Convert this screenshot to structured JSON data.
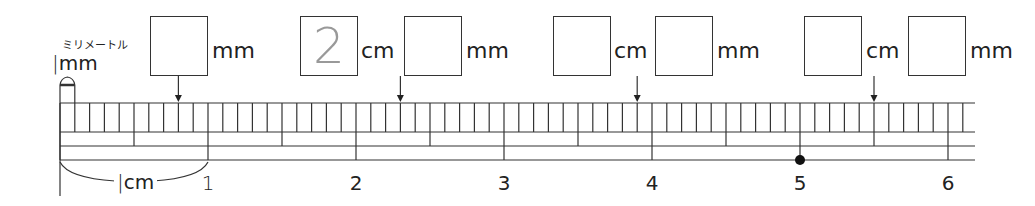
{
  "legend": {
    "mm_reading": "ミリメートル",
    "mm_label": "mm",
    "cm_label": "cm"
  },
  "questions": [
    {
      "id": 1,
      "arrow_mm": 8,
      "cm_value": null,
      "mm_value": "",
      "units": [
        "mm"
      ]
    },
    {
      "id": 2,
      "arrow_mm": 23,
      "cm_value": "2",
      "mm_value": "",
      "units": [
        "cm",
        "mm"
      ]
    },
    {
      "id": 3,
      "arrow_mm": 39,
      "cm_value": "",
      "mm_value": "",
      "units": [
        "cm",
        "mm"
      ]
    },
    {
      "id": 4,
      "arrow_mm": 55,
      "cm_value": "",
      "mm_value": "",
      "units": [
        "cm",
        "mm"
      ]
    }
  ],
  "ruler": {
    "numbers": [
      "1",
      "2",
      "3",
      "4",
      "5",
      "6"
    ],
    "total_mm": 62,
    "marker_at_cm": 5,
    "colors": {
      "line": "#333333",
      "answer_text": "#999999",
      "marker": "#111111"
    }
  }
}
